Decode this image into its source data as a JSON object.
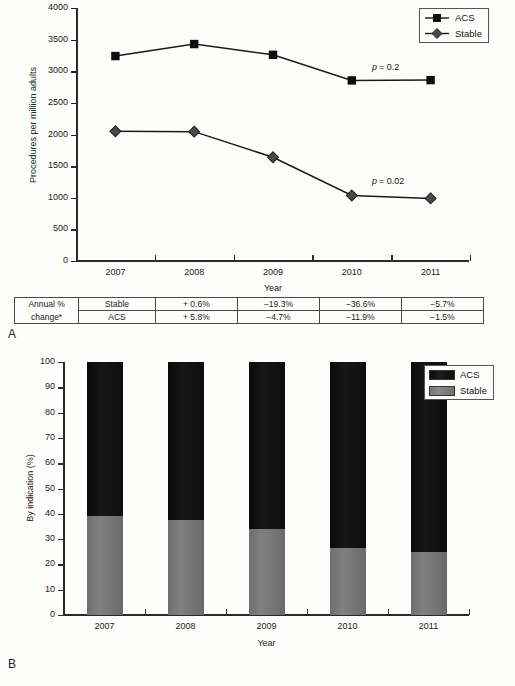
{
  "figure": {
    "panel_a_label": "A",
    "panel_b_label": "B"
  },
  "chart_data": [
    {
      "id": "panel-a",
      "type": "line",
      "title": "",
      "xlabel": "Year",
      "ylabel": "Procedures per million adults",
      "categories": [
        "2007",
        "2008",
        "2009",
        "2010",
        "2011"
      ],
      "x": [
        2007,
        2008,
        2009,
        2010,
        2011
      ],
      "ylim": [
        0,
        4000
      ],
      "yticks": [
        0,
        500,
        1000,
        1500,
        2000,
        2500,
        3000,
        3500,
        4000
      ],
      "ytick_labels": [
        "0",
        "500",
        "1000",
        "1500",
        "2000",
        "2500",
        "3000",
        "3500",
        "4000"
      ],
      "grid": false,
      "legend_position": "top-right",
      "series": [
        {
          "name": "ACS",
          "marker": "square",
          "color": "#111111",
          "values": [
            3240,
            3430,
            3260,
            2855,
            2860
          ]
        },
        {
          "name": "Stable",
          "marker": "diamond",
          "color": "#555555",
          "values": [
            2050,
            2045,
            1640,
            1035,
            990
          ]
        }
      ],
      "annotations": [
        {
          "id": "p-acs",
          "text_italic": "p",
          "text_rest": " = 0.2",
          "series": "ACS"
        },
        {
          "id": "p-stable",
          "text_italic": "p",
          "text_rest": " = 0.02",
          "series": "Stable"
        }
      ]
    },
    {
      "id": "panel-b",
      "type": "bar",
      "stacked": true,
      "title": "",
      "xlabel": "Year",
      "ylabel": "By indication (%)",
      "categories": [
        "2007",
        "2008",
        "2009",
        "2010",
        "2011"
      ],
      "ylim": [
        0,
        100
      ],
      "yticks": [
        0,
        10,
        20,
        30,
        40,
        50,
        60,
        70,
        80,
        90,
        100
      ],
      "ytick_labels": [
        "0",
        "10",
        "20",
        "30",
        "40",
        "50",
        "60",
        "70",
        "80",
        "90",
        "100"
      ],
      "grid": false,
      "legend_position": "right",
      "series": [
        {
          "name": "Stable",
          "color": "#787878",
          "values": [
            39.0,
            37.5,
            34.0,
            26.5,
            25.0
          ]
        },
        {
          "name": "ACS",
          "color": "#121212",
          "values": [
            61.0,
            62.5,
            66.0,
            73.5,
            75.0
          ]
        }
      ]
    }
  ],
  "panel_a": {
    "ylabel": "Procedures per million adults",
    "xlabel": "Year",
    "legend": [
      {
        "label": "ACS",
        "marker": "square"
      },
      {
        "label": "Stable",
        "marker": "diamond"
      }
    ],
    "p_acs_italic": "p",
    "p_acs_rest": "= 0.2",
    "p_stable_italic": "p",
    "p_stable_rest": "= 0.02"
  },
  "panel_b": {
    "ylabel": "By indication (%)",
    "xlabel": "Year",
    "legend": [
      {
        "label": "ACS",
        "swatch": "acs"
      },
      {
        "label": "Stable",
        "swatch": "stable"
      }
    ]
  },
  "table": {
    "row_header_line1": "Annual %",
    "row_header_line2": "change*",
    "rows": [
      {
        "series": "Stable",
        "values": [
          "+ 0.6%",
          "−19.3%",
          "−36.6%",
          "−5.7%"
        ]
      },
      {
        "series": "ACS",
        "values": [
          "+ 5.8%",
          "−4.7%",
          "−11.9%",
          "−1.5%"
        ]
      }
    ]
  }
}
